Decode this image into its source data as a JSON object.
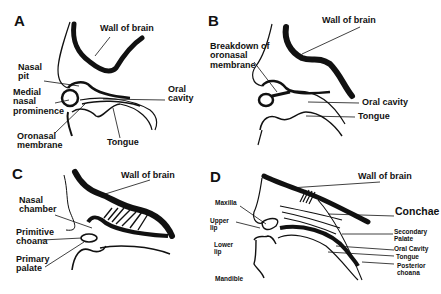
{
  "panels": [
    {
      "letter": "A",
      "labels": {
        "wall_of_brain": "Wall of brain",
        "nasal_pit": "Nasal\npit",
        "medial_nasal_prominence": "Medial\nnasal\nprominence",
        "oral_cavity": "Oral\ncavity",
        "oronasal_membrane": "Oronasal\nmembrane",
        "tongue": "Tongue"
      }
    },
    {
      "letter": "B",
      "labels": {
        "wall_of_brain": "Wall of brain",
        "breakdown_of_oronasal_membrane": "Breakdown of\noronasal\nmembrane",
        "oral_cavity": "Oral cavity",
        "tongue": "Tongue"
      }
    },
    {
      "letter": "C",
      "labels": {
        "wall_of_brain": "Wall of brain",
        "nasal_chamber": "Nasal\nchamber",
        "primitive_choana": "Primitive\nchoana",
        "primary_palate": "Primary\npalate"
      }
    },
    {
      "letter": "D",
      "labels": {
        "wall_of_brain": "Wall of brain",
        "conchae": "Conchae",
        "maxilla": "Maxilla",
        "upper_lip": "Upper\nlip",
        "lower_lip": "Lower\nlip",
        "mandible": "Mandible",
        "secondary_palate": "Secondary\nPalate",
        "oral_cavity": "Oral Cavity",
        "tongue": "Tongue",
        "posterior_choana": "Posterior\nchoana"
      }
    }
  ]
}
